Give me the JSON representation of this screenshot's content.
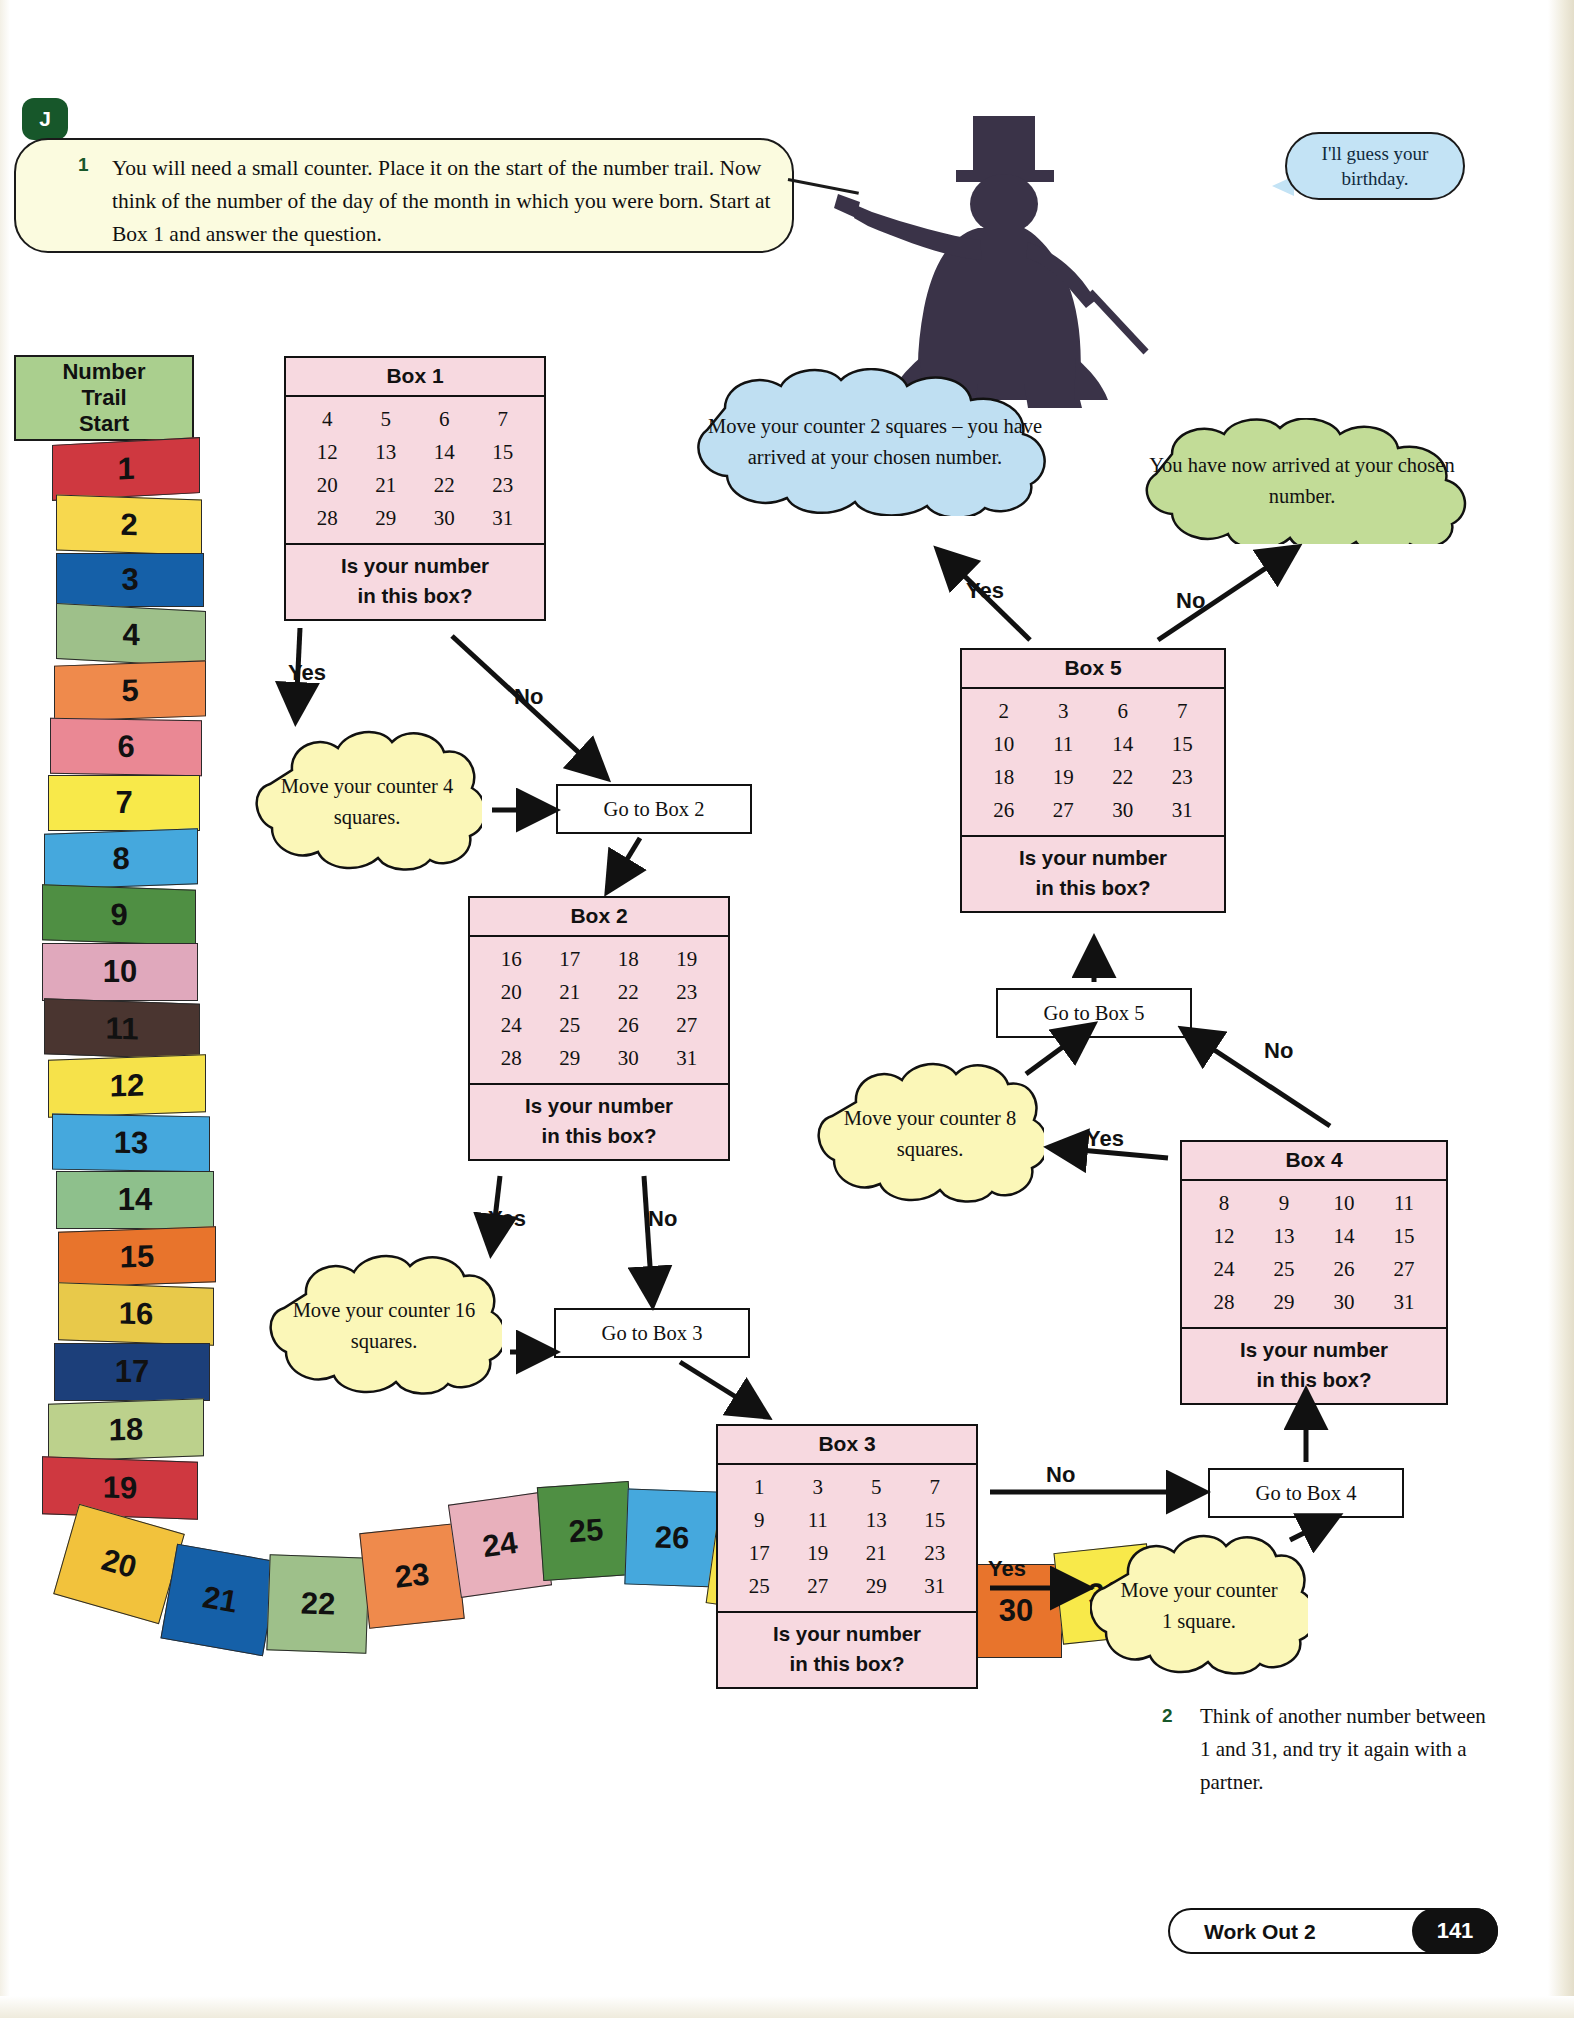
{
  "section_badge": "J",
  "instruction": {
    "number": "1",
    "text": "You will need a small counter. Place it on the start of the number trail. Now think of the number of the day of the month in which you were born. Start at Box 1 and answer the question."
  },
  "magician": {
    "bubble_text": "I'll guess your birthday."
  },
  "trail": {
    "header_line1": "Number",
    "header_line2": "Trail",
    "header_line3": "Start",
    "segments": [
      {
        "n": "1",
        "color": "#cf3840"
      },
      {
        "n": "2",
        "color": "#f7d84e"
      },
      {
        "n": "3",
        "color": "#1560a8"
      },
      {
        "n": "4",
        "color": "#9ec08a"
      },
      {
        "n": "5",
        "color": "#ef8a4c"
      },
      {
        "n": "6",
        "color": "#ea8894"
      },
      {
        "n": "7",
        "color": "#f8e94a"
      },
      {
        "n": "8",
        "color": "#45a8dd"
      },
      {
        "n": "9",
        "color": "#4f8f43"
      },
      {
        "n": "10",
        "color": "#e0a8bc"
      },
      {
        "n": "11",
        "color": "#4a3530"
      },
      {
        "n": "12",
        "color": "#f6e24a"
      },
      {
        "n": "13",
        "color": "#45a8dd"
      },
      {
        "n": "14",
        "color": "#8ec08c"
      },
      {
        "n": "15",
        "color": "#e8742c"
      },
      {
        "n": "16",
        "color": "#e8c94a"
      },
      {
        "n": "17",
        "color": "#1c3f7a"
      },
      {
        "n": "18",
        "color": "#bcd18c"
      },
      {
        "n": "19",
        "color": "#cf3840"
      },
      {
        "n": "20",
        "color": "#f2c23c"
      },
      {
        "n": "21",
        "color": "#1560a8"
      },
      {
        "n": "22",
        "color": "#9ec08a"
      },
      {
        "n": "23",
        "color": "#ef8a4c"
      },
      {
        "n": "24",
        "color": "#e8b0bc"
      },
      {
        "n": "25",
        "color": "#4f8f43"
      },
      {
        "n": "26",
        "color": "#45a8dd"
      },
      {
        "n": "27",
        "color": "#f6e24a"
      },
      {
        "n": "28",
        "color": "#e8836c"
      },
      {
        "n": "29",
        "color": "#6d3038"
      },
      {
        "n": "30",
        "color": "#e8742c"
      },
      {
        "n": "31",
        "color": "#f8e94a"
      }
    ]
  },
  "boxes": {
    "box1": {
      "title": "Box 1",
      "rows": [
        [
          "4",
          "5",
          "6",
          "7"
        ],
        [
          "12",
          "13",
          "14",
          "15"
        ],
        [
          "20",
          "21",
          "22",
          "23"
        ],
        [
          "28",
          "29",
          "30",
          "31"
        ]
      ],
      "question_line1": "Is your number",
      "question_line2": "in this box?"
    },
    "box2": {
      "title": "Box 2",
      "rows": [
        [
          "16",
          "17",
          "18",
          "19"
        ],
        [
          "20",
          "21",
          "22",
          "23"
        ],
        [
          "24",
          "25",
          "26",
          "27"
        ],
        [
          "28",
          "29",
          "30",
          "31"
        ]
      ],
      "question_line1": "Is your number",
      "question_line2": "in this box?"
    },
    "box3": {
      "title": "Box 3",
      "rows": [
        [
          "1",
          "3",
          "5",
          "7"
        ],
        [
          "9",
          "11",
          "13",
          "15"
        ],
        [
          "17",
          "19",
          "21",
          "23"
        ],
        [
          "25",
          "27",
          "29",
          "31"
        ]
      ],
      "question_line1": "Is your number",
      "question_line2": "in this box?"
    },
    "box4": {
      "title": "Box 4",
      "rows": [
        [
          "8",
          "9",
          "10",
          "11"
        ],
        [
          "12",
          "13",
          "14",
          "15"
        ],
        [
          "24",
          "25",
          "26",
          "27"
        ],
        [
          "28",
          "29",
          "30",
          "31"
        ]
      ],
      "question_line1": "Is your number",
      "question_line2": "in this box?"
    },
    "box5": {
      "title": "Box 5",
      "rows": [
        [
          "2",
          "3",
          "6",
          "7"
        ],
        [
          "10",
          "11",
          "14",
          "15"
        ],
        [
          "18",
          "19",
          "22",
          "23"
        ],
        [
          "26",
          "27",
          "30",
          "31"
        ]
      ],
      "question_line1": "Is your number",
      "question_line2": "in this box?"
    }
  },
  "clouds": {
    "move4": "Move your counter 4 squares.",
    "move16": "Move your counter 16 squares.",
    "move8": "Move your counter 8 squares.",
    "move1": "Move your counter 1 square.",
    "move2_blue": "Move your counter 2 squares – you have arrived at your chosen number.",
    "arrived_green": "You have now arrived at your chosen number."
  },
  "gotos": {
    "box2": "Go to Box 2",
    "box3": "Go to Box 3",
    "box4": "Go to Box 4",
    "box5": "Go to Box 5"
  },
  "labels": {
    "yes": "Yes",
    "no": "No"
  },
  "question2": {
    "number": "2",
    "text": "Think of another number between 1 and 31, and try it again with a partner."
  },
  "footer": {
    "title": "Work Out 2",
    "page": "141"
  },
  "colors": {
    "accent_green": "#17572a",
    "box_pink": "#f7d9e0",
    "cloud_yellow": "#fbf7b8",
    "cloud_blue": "#bfdff2",
    "cloud_green": "#c2dc97",
    "trail_header": "#aacf8e"
  }
}
